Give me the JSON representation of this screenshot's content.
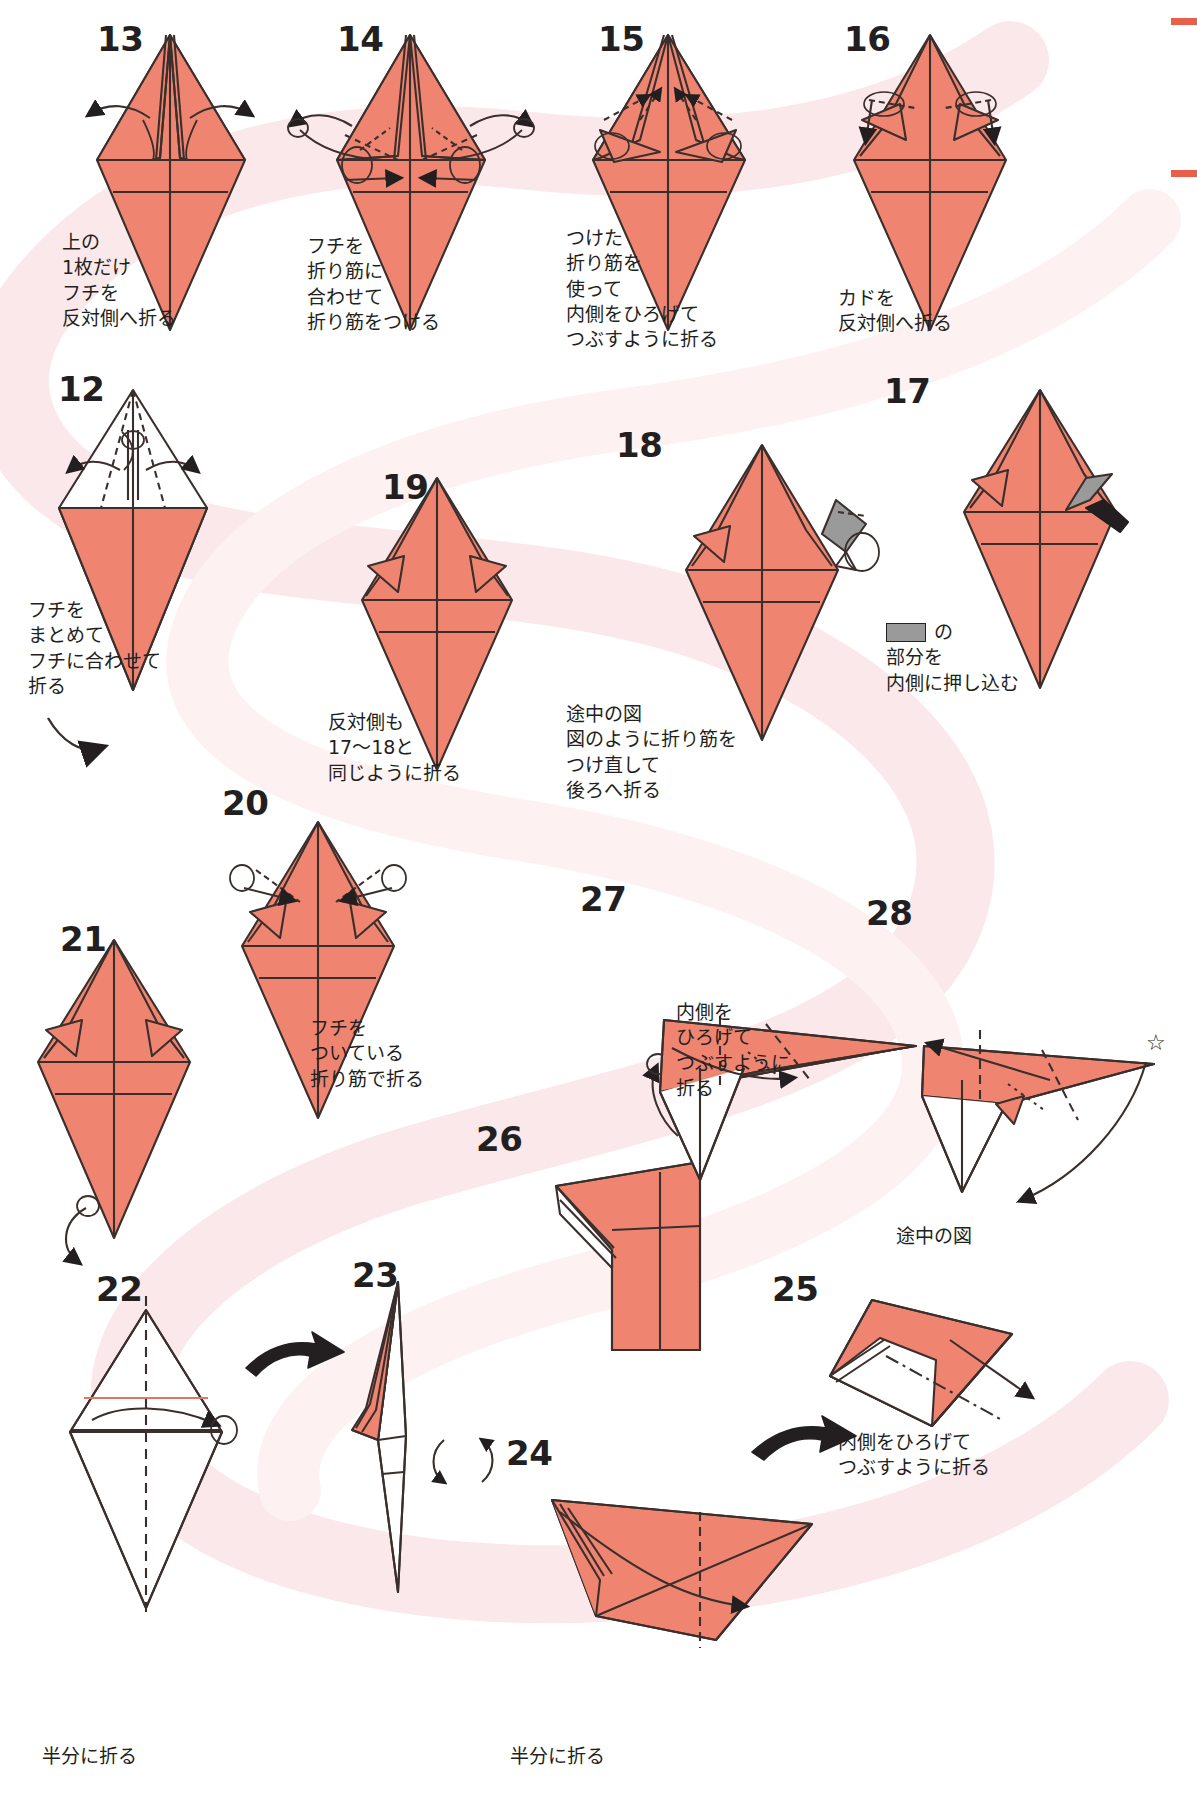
{
  "document": {
    "kind": "origami-instruction-diagram",
    "language": "ja",
    "paper_color": "#ef8571",
    "paper_shadow": "#e07663",
    "ribbon_color": "#fbe8ea",
    "gray_fill": "#9a9a9a",
    "line_color": "#231f20",
    "edge_mark_color": "#e8604c"
  },
  "steps": [
    {
      "number": "12",
      "caption": "フチを\nまとめて\nフチに合わせて\n折る",
      "shape": "kite-open-top"
    },
    {
      "number": "13",
      "caption": "上の\n1枚だけ\nフチを\n反対側へ折る",
      "shape": "kite-flaps"
    },
    {
      "number": "14",
      "caption": "フチを\n折り筋に\n合わせて\n折り筋をつける",
      "shape": "kite-flaps"
    },
    {
      "number": "15",
      "caption": "つけた\n折り筋を\n使って\n内側をひろげて\nつぶすように折る",
      "shape": "kite-squash"
    },
    {
      "number": "16",
      "caption": "カドを\n反対側へ折る",
      "shape": "kite-points"
    },
    {
      "number": "17",
      "caption": "の\n部分を\n内側に押し込む",
      "has_gray_swatch": true,
      "shape": "kite-gray-corner"
    },
    {
      "number": "18",
      "caption": "途中の図\n図のように折り筋を\nつけ直して\n後ろへ折る",
      "shape": "kite-gray-corner"
    },
    {
      "number": "19",
      "caption": "反対側も\n17〜18と\n同じように折る",
      "shape": "kite-plain"
    },
    {
      "number": "20",
      "caption": "フチを\nついている\n折り筋で折る",
      "shape": "kite-fold-edges"
    },
    {
      "number": "21",
      "caption": "",
      "shape": "kite-narrow"
    },
    {
      "number": "22",
      "caption": "半分に折る",
      "shape": "kite-white"
    },
    {
      "number": "23",
      "caption": "",
      "shape": "half-sliver"
    },
    {
      "number": "24",
      "caption": "半分に折る",
      "shape": "long-wing"
    },
    {
      "number": "25",
      "caption": "内側をひろげて\nつぶすように折る",
      "shape": "long-wing-right"
    },
    {
      "number": "26",
      "caption": "",
      "shape": "wing-block"
    },
    {
      "number": "27",
      "caption": "内側を\nひろげて\nつぶすように\n折る",
      "shape": "wing-point"
    },
    {
      "number": "28",
      "caption": "途中の図",
      "shape": "wing-point-star"
    }
  ],
  "symbols": {
    "rotate_arrow": "turn-over-arrow",
    "progress_arrow": "next-step-arrow",
    "star": "☆",
    "range_tilde": "〜"
  }
}
